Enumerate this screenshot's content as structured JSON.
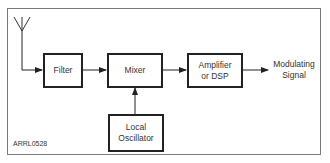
{
  "diagram": {
    "blocks": {
      "filter": "Filter",
      "mixer": "Mixer",
      "amplifier_line1": "Amplifier",
      "amplifier_line2": "or DSP",
      "local_osc_line1": "Local",
      "local_osc_line2": "Oscillator"
    },
    "output_label_line1": "Modulating",
    "output_label_line2": "Signal",
    "figure_id": "ARRL0528",
    "colors": {
      "line": "#222222",
      "frame": "#7a7a7a",
      "text": "#333333"
    }
  }
}
